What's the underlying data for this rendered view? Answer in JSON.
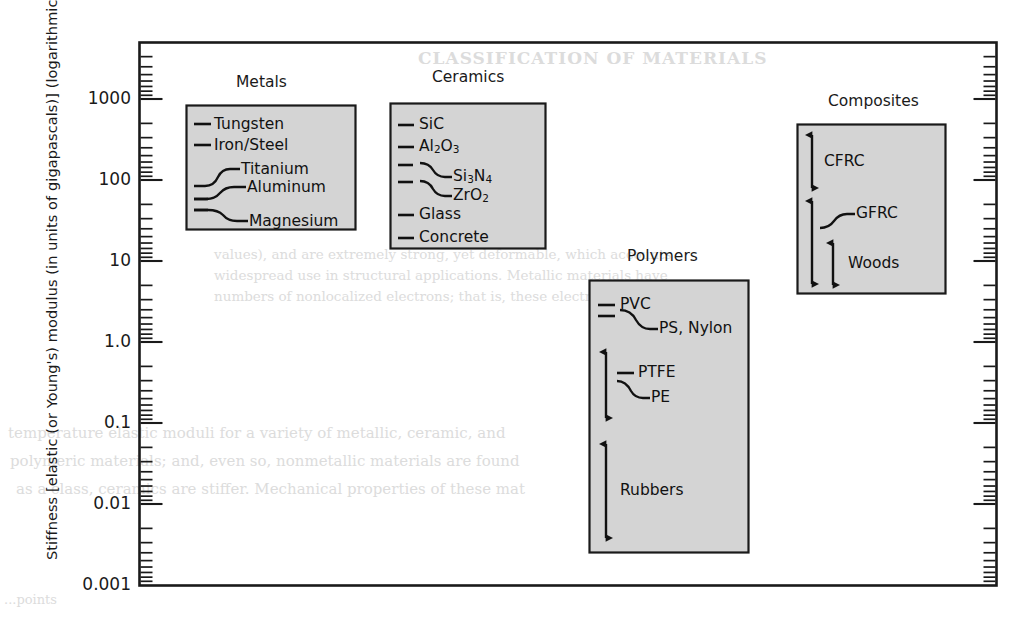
{
  "figure": {
    "y_axis_title": "Stiffness [elastic (or Young's) modulus (in units of gigapascals)] (logarithmic scale)",
    "tick_labels": [
      "1000",
      "100",
      "10",
      "1.0",
      "0.1",
      "0.01",
      "0.001"
    ],
    "frame_color": "#1a1a1a",
    "box_fill": "#d4d4d4",
    "box_stroke": "#1a1a1a",
    "background": "#ffffff"
  },
  "groups": {
    "metals": {
      "title": "Metals",
      "items": [
        {
          "label": "Tungsten"
        },
        {
          "label": "Iron/Steel"
        },
        {
          "label": "Titanium"
        },
        {
          "label": "Aluminum"
        },
        {
          "label": "Magnesium"
        }
      ]
    },
    "ceramics": {
      "title": "Ceramics",
      "items": [
        {
          "label": "SiC",
          "html": "SiC"
        },
        {
          "label": "Al2O3",
          "html": "Al<sub>2</sub>O<sub>3</sub>"
        },
        {
          "label": "Si3N4",
          "html": "Si<sub>3</sub>N<sub>4</sub>"
        },
        {
          "label": "ZrO2",
          "html": "ZrO<sub>2</sub>"
        },
        {
          "label": "Glass",
          "html": "Glass"
        },
        {
          "label": "Concrete",
          "html": "Concrete"
        }
      ]
    },
    "polymers": {
      "title": "Polymers",
      "items": [
        {
          "label": "PVC"
        },
        {
          "label": "PS, Nylon"
        },
        {
          "label": "PTFE"
        },
        {
          "label": "PE"
        },
        {
          "label": "Rubbers"
        }
      ]
    },
    "composites": {
      "title": "Composites",
      "items": [
        {
          "label": "CFRC"
        },
        {
          "label": "GFRC"
        },
        {
          "label": "Woods"
        }
      ]
    }
  },
  "ghost_text": {
    "header": "CLASSIFICATION OF MATERIALS",
    "line1": "values), and are extremely strong, yet deformable, which accounts",
    "line2": "widespread use in structural applications. Metallic materials have",
    "line3": "numbers of nonlocalized electrons; that is, these electrons are not",
    "line4": "temperature elastic moduli for a variety of metallic, ceramic, and",
    "line5": "polymeric materials; and, even so, nonmetallic materials are found",
    "line6": "as a class, ceramics are stiffer. Mechanical properties of these mat",
    "line7": "...points"
  },
  "chart_data": {
    "type": "bar",
    "title": "",
    "xlabel": "",
    "ylabel": "Stiffness [elastic (or Young's) modulus (in units of gigapascals)] (logarithmic scale)",
    "yscale": "log",
    "ylim": [
      0.001,
      3000
    ],
    "ytick_values": [
      1000,
      100,
      10,
      1.0,
      0.1,
      0.01,
      0.001
    ],
    "ytick_labels": [
      "1000",
      "100",
      "10",
      "1.0",
      "0.1",
      "0.01",
      "0.001"
    ],
    "grid": false,
    "legend": "none",
    "categories": [
      "Metals",
      "Ceramics",
      "Polymers",
      "Composites"
    ],
    "series": [
      {
        "name": "Metals",
        "points": [
          {
            "label": "Tungsten",
            "value": 407,
            "type": "tick"
          },
          {
            "label": "Iron/Steel",
            "value": 207,
            "type": "tick"
          },
          {
            "label": "Titanium",
            "value": 107,
            "type": "tick"
          },
          {
            "label": "Aluminum",
            "value": 69,
            "type": "tick"
          },
          {
            "label": "Magnesium",
            "value": 45,
            "type": "tick"
          }
        ]
      },
      {
        "name": "Ceramics",
        "points": [
          {
            "label": "SiC",
            "value": 430,
            "type": "tick"
          },
          {
            "label": "Al2O3",
            "value": 310,
            "type": "tick"
          },
          {
            "label": "Si3N4",
            "value": 250,
            "type": "tick"
          },
          {
            "label": "ZrO2",
            "value": 200,
            "type": "tick"
          },
          {
            "label": "Glass",
            "value": 70,
            "type": "tick"
          },
          {
            "label": "Concrete",
            "value": 40,
            "type": "tick"
          }
        ]
      },
      {
        "name": "Polymers",
        "points": [
          {
            "label": "PVC",
            "value": 3.0,
            "type": "tick"
          },
          {
            "label": "PS, Nylon",
            "value": 2.6,
            "type": "tick"
          },
          {
            "label": "PTFE",
            "value": 0.6,
            "type": "tick"
          },
          {
            "label": "PE",
            "value": 0.4,
            "type": "tick"
          },
          {
            "label": "Rubbers",
            "range": [
              0.0015,
              0.06
            ],
            "type": "range"
          }
        ],
        "ranges": [
          {
            "label": "polymer-mid-range",
            "range": [
              0.2,
              1.6
            ]
          }
        ]
      },
      {
        "name": "Composites",
        "points": [
          {
            "label": "CFRC",
            "range": [
              70,
              330
            ],
            "type": "range"
          },
          {
            "label": "GFRC",
            "range": [
              18,
              45
            ],
            "type": "range"
          },
          {
            "label": "Woods",
            "range": [
              7,
              22
            ],
            "type": "range"
          }
        ]
      }
    ]
  }
}
